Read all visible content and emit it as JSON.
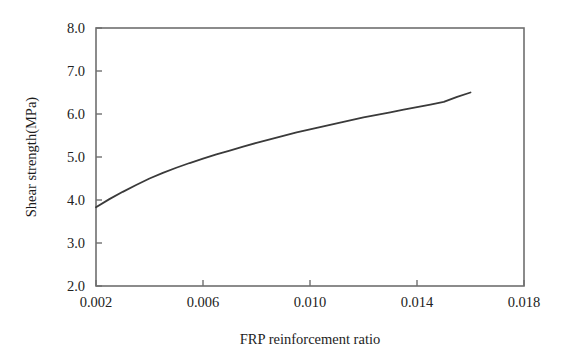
{
  "figure": {
    "background_color": "#ffffff",
    "frame_color": "#6f6f6f",
    "curve_color": "#3a3a3a"
  },
  "chart_data": {
    "type": "line",
    "title": "",
    "xlabel": "FRP reinforcement ratio",
    "ylabel": "Shear strength(MPa)",
    "xlim": [
      0.002,
      0.018
    ],
    "ylim": [
      2.0,
      8.0
    ],
    "grid": false,
    "legend": null,
    "xticks": [
      0.002,
      0.006,
      0.01,
      0.014,
      0.018
    ],
    "xtick_labels": [
      "0.002",
      "0.006",
      "0.010",
      "0.014",
      "0.018"
    ],
    "yticks": [
      2.0,
      3.0,
      4.0,
      5.0,
      6.0,
      7.0,
      8.0
    ],
    "ytick_labels": [
      "2.0",
      "3.0",
      "4.0",
      "5.0",
      "6.0",
      "7.0",
      "8.0"
    ],
    "series": [
      {
        "name": "Shear strength vs FRP reinforcement ratio",
        "color": "#3a3a3a",
        "line_width": 1.8,
        "x": [
          0.002,
          0.0025,
          0.003,
          0.0035,
          0.004,
          0.0045,
          0.005,
          0.0055,
          0.006,
          0.0065,
          0.007,
          0.0075,
          0.008,
          0.0085,
          0.009,
          0.0095,
          0.01,
          0.0105,
          0.011,
          0.0115,
          0.012,
          0.0125,
          0.013,
          0.0135,
          0.014,
          0.0145,
          0.015,
          0.0155,
          0.016
        ],
        "y": [
          3.83,
          4.02,
          4.19,
          4.35,
          4.5,
          4.63,
          4.75,
          4.86,
          4.96,
          5.06,
          5.15,
          5.24,
          5.33,
          5.41,
          5.49,
          5.57,
          5.64,
          5.71,
          5.78,
          5.85,
          5.92,
          5.98,
          6.04,
          6.1,
          6.16,
          6.22,
          6.28,
          6.4,
          6.5
        ]
      }
    ]
  },
  "axes": {
    "x_axis_title": "FRP reinforcement ratio",
    "y_axis_title": "Shear strength(MPa)"
  }
}
